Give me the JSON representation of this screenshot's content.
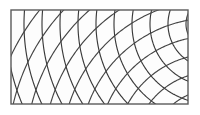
{
  "figure": {
    "type": "geometric-lattice-diagram",
    "canvas": {
      "width": 200,
      "height": 115,
      "background_color": "#ffffff"
    },
    "frame": {
      "name": "rectangular-border",
      "x": 11,
      "y": 10,
      "width": 177,
      "height": 94,
      "stroke_color": "#5a5a5a",
      "stroke_width": 1.4,
      "fill_color": "#ffffff"
    },
    "inner_fill": {
      "color": "#fdfdfd"
    },
    "curves": {
      "stroke_color": "#3a3a3a",
      "stroke_width": 1.15,
      "stroke_color_secondary": "#444444",
      "families": [
        {
          "name": "arc-family-concentric",
          "kind": "concentric-arcs",
          "center_x": 212,
          "center_y": 24,
          "radii": [
            26,
            44,
            62,
            80,
            98,
            116,
            134,
            152,
            170,
            188,
            206,
            224
          ]
        },
        {
          "name": "arc-family-radial",
          "kind": "concentric-arcs",
          "center_x": 212,
          "center_y": 150,
          "radii": [
            24,
            42,
            60,
            78,
            96,
            114,
            132,
            150,
            168,
            186,
            204,
            222
          ]
        }
      ]
    }
  }
}
